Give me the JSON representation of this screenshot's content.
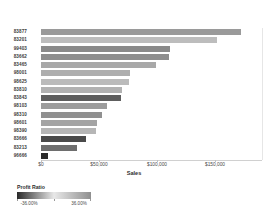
{
  "chart_data": {
    "type": "bar",
    "orientation": "horizontal",
    "title": "",
    "xlabel": "Sales",
    "ylabel": "",
    "xlim": [
      0,
      190000
    ],
    "grid": false,
    "categories": [
      "83877",
      "83201",
      "99403",
      "83662",
      "83465",
      "98001",
      "98625",
      "83810",
      "83843",
      "98103",
      "98310",
      "98601",
      "98390",
      "83666",
      "83213",
      "96666"
    ],
    "values": [
      172000,
      152000,
      111000,
      110000,
      99000,
      77000,
      76000,
      70000,
      69000,
      57000,
      53000,
      48000,
      47000,
      39000,
      31000,
      6000
    ],
    "colors": [
      "#9a9a9a",
      "#bdbdbd",
      "#8a8a8a",
      "#8e8e8e",
      "#a8a8a8",
      "#aeaeae",
      "#bbbbbb",
      "#b2b2b2",
      "#5e5e5e",
      "#9c9c9c",
      "#909090",
      "#a4a4a4",
      "#b6b6b6",
      "#4a4a4a",
      "#6e6e6e",
      "#2a2a2a"
    ],
    "xticks": [
      0,
      50000,
      100000,
      150000
    ],
    "xticklabels": [
      "$0",
      "$50,000",
      "$100,000",
      "$150,000"
    ],
    "legend": {
      "title": "Profit Ratio",
      "min_label": "-36.00%",
      "max_label": "36.00%",
      "min_value": -36.0,
      "max_value": 36.0,
      "ramp_start_color": "#2a2a2a",
      "ramp_mid_color": "#e8e8e8",
      "ramp_end_color": "#8f8f8f",
      "position": "below-left"
    }
  }
}
